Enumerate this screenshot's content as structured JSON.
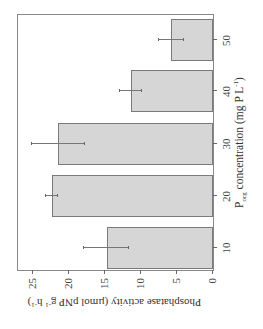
{
  "chart_data": {
    "type": "bar",
    "title": "",
    "orientation_note": "figure rendered rotated 90 degrees counter-clockwise",
    "categories": [
      "10",
      "20",
      "30",
      "40",
      "50"
    ],
    "values": [
      14.8,
      22.4,
      21.5,
      11.4,
      5.8
    ],
    "error_bars": [
      3.1,
      0.8,
      3.7,
      1.5,
      1.7
    ],
    "xlabel": "P_org concentration (mg P L^-1)",
    "xlabel_parts": {
      "main": "P",
      "sub": "org",
      "rest": " concentration (mg P L",
      "sup": "-1",
      "close": ")"
    },
    "ylabel": "Phosphatase activity (µmol pNP g^-1 h^-1)",
    "ylabel_parts": {
      "main": "Phosphatase activity (µmol pNP g",
      "sup1": "-1",
      "mid": " h",
      "sup2": "-1",
      "close": ")"
    },
    "yticks": [
      "0",
      "5",
      "10",
      "15",
      "20",
      "25"
    ],
    "ylim": [
      0,
      27.4
    ],
    "grid": false,
    "legend": null,
    "bar_color": "#d6d6d6",
    "bar_edge_color": "#7a7a7a"
  }
}
